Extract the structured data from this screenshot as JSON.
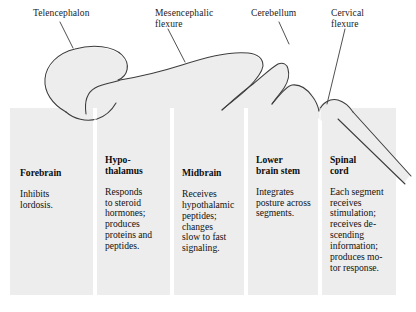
{
  "figure": {
    "kind": "schematic-diagram",
    "background_color": "#ffffff",
    "panel_fill": "#ededed",
    "outline_color": "#3a3a3a",
    "text_color": "#111111"
  },
  "callouts": [
    {
      "id": "telencephalon",
      "label": "Telencephalon"
    },
    {
      "id": "mesencephalic-flexure",
      "label": "Mesencephalic\nflexure"
    },
    {
      "id": "cerebellum",
      "label": "Cerebellum"
    },
    {
      "id": "cervical-flexure",
      "label": "Cervical\nflexure"
    }
  ],
  "columns": [
    {
      "id": "forebrain",
      "title": "Forebrain",
      "body": "Inhibits\nlordosis."
    },
    {
      "id": "hypothalamus",
      "title": "Hypo-\nthalamus",
      "body": "Responds\nto steroid\nhormones;\nproduces\nproteins and\npeptides."
    },
    {
      "id": "midbrain",
      "title": "Midbrain",
      "body": "Receives\nhypothalamic\npeptides;\nchanges\nslow to fast\nsignaling."
    },
    {
      "id": "lower-brain-stem",
      "title": "Lower\nbrain stem",
      "body": "Integrates\nposture across\nsegments."
    },
    {
      "id": "spinal-cord",
      "title": "Spinal\ncord",
      "body": "Each segment\nreceives\nstimulation;\nreceives de-\nscending\ninformation;\nproduces mo-\ntor response."
    }
  ]
}
